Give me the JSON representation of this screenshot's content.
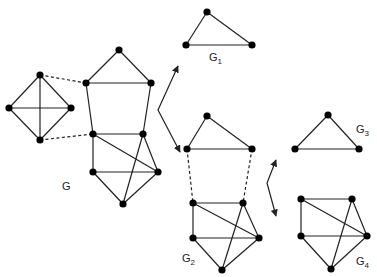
{
  "labels": {
    "g": {
      "text": "G",
      "x": 62,
      "y": 180
    },
    "g1": {
      "text": "G",
      "sub": "1",
      "x": 209,
      "y": 51
    },
    "g2": {
      "text": "G",
      "sub": "2",
      "x": 182,
      "y": 252
    },
    "g3": {
      "text": "G",
      "sub": "3",
      "x": 356,
      "y": 123
    },
    "g4": {
      "text": "G",
      "sub": "4",
      "x": 356,
      "y": 255
    }
  },
  "colors": {
    "edge": "#222222",
    "node": "#000000"
  },
  "graphs": [
    {
      "id": "G",
      "nodes": [
        [
          40,
          75
        ],
        [
          9,
          108
        ],
        [
          71,
          108
        ],
        [
          40,
          140
        ],
        [
          119,
          50
        ],
        [
          86,
          83
        ],
        [
          151,
          83
        ],
        [
          93,
          134
        ],
        [
          143,
          134
        ],
        [
          93,
          172
        ],
        [
          158,
          172
        ],
        [
          123,
          204
        ]
      ],
      "edges": [
        [
          0,
          1
        ],
        [
          0,
          2
        ],
        [
          1,
          3
        ],
        [
          2,
          3
        ],
        [
          0,
          3
        ],
        [
          1,
          2
        ],
        [
          4,
          5
        ],
        [
          4,
          6
        ],
        [
          5,
          6
        ],
        [
          5,
          7
        ],
        [
          6,
          8
        ],
        [
          7,
          8
        ],
        [
          7,
          9
        ],
        [
          7,
          10
        ],
        [
          8,
          10
        ],
        [
          8,
          11
        ],
        [
          9,
          10
        ],
        [
          9,
          11
        ],
        [
          10,
          11
        ]
      ],
      "dashed": [
        [
          0,
          5
        ],
        [
          3,
          7
        ]
      ]
    },
    {
      "id": "G1",
      "nodes": [
        [
          207,
          12
        ],
        [
          186,
          45
        ],
        [
          252,
          45
        ]
      ],
      "edges": [
        [
          0,
          1
        ],
        [
          0,
          2
        ],
        [
          1,
          2
        ]
      ],
      "dashed": []
    },
    {
      "id": "G2",
      "nodes": [
        [
          207,
          116
        ],
        [
          187,
          149
        ],
        [
          252,
          149
        ],
        [
          193,
          203
        ],
        [
          243,
          203
        ],
        [
          193,
          238
        ],
        [
          259,
          238
        ],
        [
          222,
          270
        ]
      ],
      "edges": [
        [
          0,
          1
        ],
        [
          0,
          2
        ],
        [
          1,
          2
        ],
        [
          3,
          4
        ],
        [
          3,
          5
        ],
        [
          3,
          6
        ],
        [
          4,
          6
        ],
        [
          4,
          7
        ],
        [
          5,
          6
        ],
        [
          5,
          7
        ],
        [
          6,
          7
        ]
      ],
      "dashed": [
        [
          1,
          3
        ],
        [
          2,
          4
        ]
      ]
    },
    {
      "id": "G3",
      "nodes": [
        [
          328,
          115
        ],
        [
          295,
          149
        ],
        [
          359,
          149
        ]
      ],
      "edges": [
        [
          0,
          1
        ],
        [
          0,
          2
        ],
        [
          1,
          2
        ]
      ],
      "dashed": []
    },
    {
      "id": "G4",
      "nodes": [
        [
          301,
          199
        ],
        [
          352,
          199
        ],
        [
          301,
          236
        ],
        [
          367,
          236
        ],
        [
          331,
          269
        ]
      ],
      "edges": [
        [
          0,
          1
        ],
        [
          0,
          2
        ],
        [
          0,
          3
        ],
        [
          1,
          3
        ],
        [
          1,
          4
        ],
        [
          2,
          3
        ],
        [
          2,
          4
        ],
        [
          3,
          4
        ]
      ],
      "dashed": []
    }
  ],
  "arrows": [
    {
      "id": "split-arrow-1",
      "mid": [
        158,
        110
      ],
      "up": [
        178,
        66
      ],
      "down": [
        180,
        152
      ]
    },
    {
      "id": "split-arrow-2",
      "mid": [
        267,
        183
      ],
      "up": [
        276,
        160
      ],
      "down": [
        276,
        216
      ]
    }
  ]
}
